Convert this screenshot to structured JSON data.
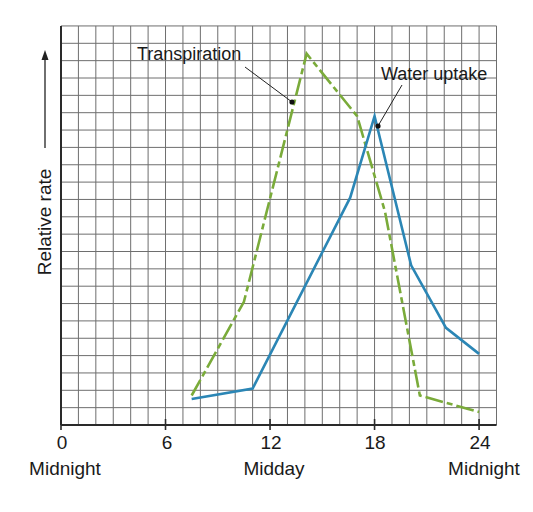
{
  "chart_data": {
    "type": "line",
    "title": "",
    "xlabel": "",
    "ylabel": "Relative rate",
    "x_ticks": [
      0,
      6,
      12,
      18,
      24
    ],
    "x_tick_sublabels": [
      {
        "x": 0,
        "label": "Midnight"
      },
      {
        "x": 12,
        "label": "Midday"
      },
      {
        "x": 24,
        "label": "Midnight"
      }
    ],
    "xlim": [
      0,
      25
    ],
    "ylim": [
      0,
      23
    ],
    "grid": true,
    "series": [
      {
        "name": "Transpiration",
        "style": "dashed",
        "color": "#7aab3a",
        "x": [
          7.5,
          10.5,
          14.1,
          17.0,
          18.6,
          20.6,
          24.0
        ],
        "values": [
          1.7,
          7.1,
          21.4,
          17.8,
          12.3,
          1.7,
          0.75
        ]
      },
      {
        "name": "Water uptake",
        "style": "solid",
        "color": "#2b86b5",
        "x": [
          7.5,
          11.0,
          16.6,
          18.0,
          20.1,
          22.1,
          24.0
        ],
        "values": [
          1.5,
          2.1,
          13.1,
          17.8,
          9.2,
          5.6,
          4.1
        ]
      }
    ],
    "annotations": [
      {
        "text": "Transpiration",
        "points_to_series": "Transpiration",
        "text_pos": [
          5.2,
          20.5
        ],
        "anchor": [
          13.2,
          17.9
        ]
      },
      {
        "text": "Water uptake",
        "points_to_series": "Water uptake",
        "text_pos": [
          18.5,
          19.3
        ],
        "anchor": [
          18.2,
          16.8
        ]
      }
    ]
  },
  "labels": {
    "ylabel": "Relative rate",
    "ticks": [
      "0",
      "6",
      "12",
      "18",
      "24"
    ],
    "sub": [
      "Midnight",
      "Midday",
      "Midnight"
    ],
    "transpiration": "Transpiration",
    "water": "Water uptake"
  },
  "colors": {
    "grid": "#6e6e6e",
    "axis": "#2a2a2a",
    "transpiration": "#7aab3a",
    "water_uptake": "#2b86b5"
  }
}
